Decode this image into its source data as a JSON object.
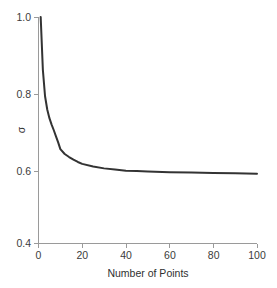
{
  "chart_data": {
    "type": "line",
    "title": "",
    "xlabel": "Number of Points",
    "ylabel": "σ",
    "xlim": [
      0,
      100
    ],
    "ylim": [
      0.4,
      1.0
    ],
    "grid": false,
    "legend": null,
    "xticks": [
      "0",
      "20",
      "40",
      "60",
      "80",
      "100"
    ],
    "xtick_values": [
      0,
      20,
      40,
      60,
      80,
      100
    ],
    "yticks": [
      "0.4",
      "0.6",
      "0.8",
      "1.0"
    ],
    "ytick_values": [
      0.4,
      0.6,
      0.8,
      1.0
    ],
    "series": [
      {
        "name": "sigma",
        "color": "#333333",
        "x": [
          1,
          2,
          3,
          4,
          5,
          6,
          7,
          8,
          9,
          10,
          12,
          14,
          16,
          18,
          20,
          25,
          30,
          35,
          40,
          45,
          50,
          60,
          70,
          80,
          90,
          100
        ],
        "y": [
          1.0,
          0.86,
          0.79,
          0.755,
          0.732,
          0.715,
          0.7,
          0.684,
          0.668,
          0.65,
          0.637,
          0.629,
          0.622,
          0.616,
          0.611,
          0.604,
          0.599,
          0.596,
          0.593,
          0.592,
          0.591,
          0.589,
          0.588,
          0.587,
          0.586,
          0.585
        ]
      }
    ]
  },
  "axes": {
    "y_axis_title": "σ",
    "x_axis_title": "Number of Points"
  }
}
